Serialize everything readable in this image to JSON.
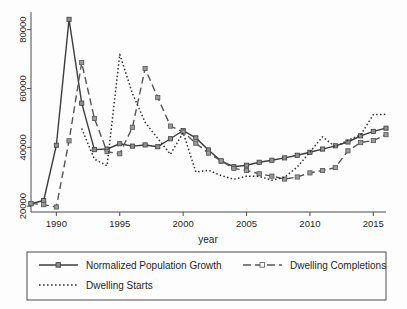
{
  "chart_data": {
    "type": "line",
    "title": "",
    "xlabel": "year",
    "ylabel": "",
    "xlim": [
      1988,
      2016
    ],
    "ylim": [
      18000,
      86000
    ],
    "grid": false,
    "legend_position": "bottom",
    "x_ticks": [
      1990,
      1995,
      2000,
      2005,
      2010,
      2015
    ],
    "x_tick_labels": [
      "1990",
      "1995",
      "2000",
      "2005",
      "2010",
      "2015"
    ],
    "y_ticks": [
      20000,
      40000,
      60000,
      80000
    ],
    "y_tick_labels": [
      "20000",
      "40000",
      "60000",
      "80000"
    ],
    "x": [
      1988,
      1989,
      1990,
      1991,
      1992,
      1993,
      1994,
      1995,
      1996,
      1997,
      1998,
      1999,
      2000,
      2001,
      2002,
      2003,
      2004,
      2005,
      2006,
      2007,
      2008,
      2009,
      2010,
      2011,
      2012,
      2013,
      2014,
      2015,
      2016
    ],
    "series": [
      {
        "name": "Normalized Population Growth",
        "style": "solid",
        "marker": "square",
        "color": "#3c3c3c",
        "values": [
          20800,
          21900,
          40700,
          83500,
          55000,
          39200,
          39400,
          41200,
          40400,
          40800,
          40200,
          42900,
          45700,
          43200,
          39100,
          35300,
          33400,
          33900,
          34900,
          35600,
          36400,
          37300,
          38300,
          39400,
          40500,
          41800,
          43900,
          45400,
          46500
        ]
      },
      {
        "name": "Dwelling Completions",
        "style": "long-dash",
        "marker": "square",
        "color": "#555555",
        "values": [
          20900,
          20500,
          19700,
          42200,
          68800,
          49800,
          38500,
          37800,
          46800,
          66800,
          56900,
          47200,
          45200,
          41400,
          38000,
          35400,
          32800,
          32100,
          31000,
          30200,
          29200,
          29900,
          31300,
          32100,
          33100,
          38800,
          41600,
          42300,
          44300
        ]
      },
      {
        "name": "Dwelling Starts",
        "style": "dotted",
        "marker": "none",
        "color": "#2e2e2e",
        "values": [
          null,
          null,
          null,
          null,
          46400,
          36000,
          33700,
          71600,
          58300,
          48500,
          43000,
          37600,
          45000,
          31600,
          32200,
          30400,
          29100,
          30200,
          30100,
          28800,
          29800,
          33300,
          38400,
          43600,
          40100,
          42400,
          44200,
          51100,
          51200
        ]
      }
    ]
  },
  "legend": {
    "items": [
      {
        "label": "Normalized Population Growth"
      },
      {
        "label": "Dwelling Completions"
      },
      {
        "label": "Dwelling Starts"
      }
    ]
  }
}
